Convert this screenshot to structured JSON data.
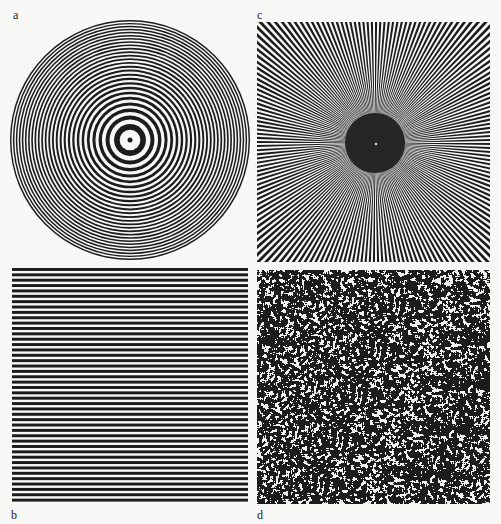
{
  "figure": {
    "panels": [
      {
        "id": "a",
        "label": "a",
        "kind": "concentric-rings",
        "rings": 26
      },
      {
        "id": "b",
        "label": "b",
        "kind": "horizontal-gratings",
        "lines": 44
      },
      {
        "id": "c",
        "label": "c",
        "kind": "radial-sunburst",
        "rays": 180
      },
      {
        "id": "d",
        "label": "d",
        "kind": "random-noise-texture"
      }
    ],
    "colors": {
      "ink": "#1c1c1c",
      "paper": "#f7f7f5"
    }
  }
}
